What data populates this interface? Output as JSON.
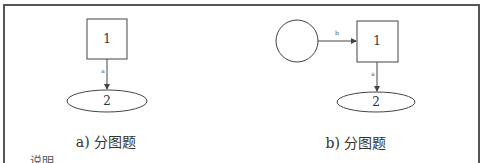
{
  "panels": [
    {
      "caption": "a) 分图题",
      "nodes": [
        {
          "id": "square",
          "shape": "rect",
          "label": "1"
        },
        {
          "id": "ellipse",
          "shape": "ellipse",
          "label": "2"
        }
      ],
      "edges": [
        {
          "from": "square",
          "to": "ellipse",
          "label": "a"
        }
      ]
    },
    {
      "caption": "b) 分图题",
      "nodes": [
        {
          "id": "circle",
          "shape": "circle",
          "label": ""
        },
        {
          "id": "square",
          "shape": "rect",
          "label": "1"
        },
        {
          "id": "ellipse",
          "shape": "ellipse",
          "label": "2"
        }
      ],
      "edges": [
        {
          "from": "circle",
          "to": "square",
          "label": "b"
        },
        {
          "from": "square",
          "to": "ellipse",
          "label": "a"
        }
      ]
    }
  ],
  "footnote": "说明",
  "colors": {
    "stroke": "#444444",
    "frame": "#555555",
    "text": "#333333"
  }
}
